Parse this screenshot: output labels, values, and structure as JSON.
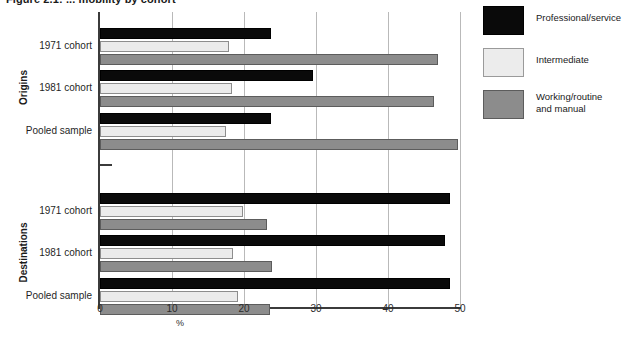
{
  "figure": {
    "title": "Figure 2.1: ... mobility by cohort"
  },
  "legend": {
    "position": "top-right",
    "items": [
      {
        "label": "Professional/service",
        "color": "#0a0a0a",
        "key": "professional"
      },
      {
        "label": "Intermediate",
        "color": "#ececec",
        "key": "intermediate"
      },
      {
        "label": "Working/routine\nand manual",
        "color": "#8c8c8c",
        "key": "working"
      }
    ]
  },
  "axis": {
    "xlabel": "%",
    "xticks": [
      "0",
      "10",
      "20",
      "30",
      "40",
      "50"
    ],
    "xmin": 0,
    "xmax": 50,
    "grid": true,
    "broken_axis": true
  },
  "groups": [
    {
      "name": "Origins",
      "categories": [
        "1971 cohort",
        "1981 cohort",
        "Pooled sample"
      ]
    },
    {
      "name": "Destinations",
      "categories": [
        "1971 cohort",
        "1981 cohort",
        "Pooled sample"
      ]
    }
  ],
  "chart_data": {
    "type": "bar",
    "orientation": "horizontal",
    "title": "Figure 2.1: ... mobility by cohort",
    "xlabel": "%",
    "ylabel": "",
    "xlim": [
      0,
      50
    ],
    "grid": true,
    "legend_position": "top-right",
    "group_labels": [
      "Origins",
      "Destinations"
    ],
    "categories": [
      "Origins / 1971 cohort",
      "Origins / 1981 cohort",
      "Origins / Pooled sample",
      "Destinations / 1971 cohort",
      "Destinations / 1981 cohort",
      "Destinations / Pooled sample"
    ],
    "series": [
      {
        "name": "Professional/service",
        "color": "#0a0a0a",
        "values": [
          23.7,
          29.6,
          23.7,
          48.6,
          47.9,
          48.6
        ]
      },
      {
        "name": "Intermediate",
        "color": "#ececec",
        "values": [
          17.9,
          18.3,
          17.5,
          19.9,
          18.5,
          19.2
        ]
      },
      {
        "name": "Working/routine and manual",
        "color": "#8c8c8c",
        "values": [
          47.0,
          46.4,
          49.7,
          23.2,
          23.9,
          23.6
        ]
      }
    ]
  },
  "layout": {
    "plot_left_px": 100,
    "plot_top_px": 12,
    "plot_width_px": 360,
    "plot_height_px": 295,
    "px_per_unit": 7.2,
    "bar_height_px": 11,
    "rows": [
      {
        "key": "origins-1971",
        "group": 0,
        "cat": 0,
        "top_px": 16
      },
      {
        "key": "origins-1981",
        "group": 0,
        "cat": 1,
        "top_px": 58
      },
      {
        "key": "origins-pooled",
        "group": 0,
        "cat": 2,
        "top_px": 101
      },
      {
        "key": "destinations-1971",
        "group": 1,
        "cat": 0,
        "top_px": 181
      },
      {
        "key": "destinations-1981",
        "group": 1,
        "cat": 1,
        "top_px": 223
      },
      {
        "key": "destinations-pooled",
        "group": 1,
        "cat": 2,
        "top_px": 266
      }
    ]
  }
}
